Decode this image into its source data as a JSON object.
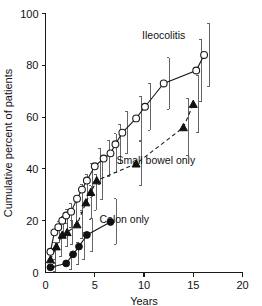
{
  "chart_data": {
    "type": "line",
    "title": "",
    "xlabel": "Years",
    "ylabel": "Cumulative percent of patients",
    "xlim": [
      0,
      20
    ],
    "ylim": [
      0,
      100
    ],
    "xticks": [
      0,
      5,
      10,
      15,
      20
    ],
    "yticks": [
      0,
      20,
      40,
      60,
      80,
      100
    ],
    "grid": false,
    "legend_position": "inline-annotations",
    "series": [
      {
        "name": "Ileocolitis",
        "marker": "open-circle",
        "linestyle": "solid",
        "label_x": 12.0,
        "label_y": 90.0,
        "points": [
          {
            "x": 0.5,
            "y": 8.0,
            "err_low": 5.0,
            "err_high": 11.5
          },
          {
            "x": 0.9,
            "y": 15.5,
            "err_low": 11.5,
            "err_high": 19.5
          },
          {
            "x": 1.3,
            "y": 17.5,
            "err_low": 13.5,
            "err_high": 21.5
          },
          {
            "x": 1.7,
            "y": 20.0,
            "err_low": 15.5,
            "err_high": 24.5
          },
          {
            "x": 2.1,
            "y": 22.0,
            "err_low": 17.5,
            "err_high": 26.5
          },
          {
            "x": 2.6,
            "y": 23.5,
            "err_low": 18.5,
            "err_high": 28.5
          },
          {
            "x": 3.2,
            "y": 28.5,
            "err_low": 23.0,
            "err_high": 34.0
          },
          {
            "x": 3.7,
            "y": 32.0,
            "err_low": 26.0,
            "err_high": 38.0
          },
          {
            "x": 4.2,
            "y": 35.5,
            "err_low": 29.0,
            "err_high": 42.0
          },
          {
            "x": 5.0,
            "y": 41.0,
            "err_low": 34.0,
            "err_high": 48.0
          },
          {
            "x": 5.9,
            "y": 44.0,
            "err_low": 37.0,
            "err_high": 51.0
          },
          {
            "x": 6.6,
            "y": 46.0,
            "err_low": 38.5,
            "err_high": 53.5
          },
          {
            "x": 7.1,
            "y": 49.5,
            "err_low": 42.0,
            "err_high": 57.0
          },
          {
            "x": 7.8,
            "y": 54.0,
            "err_low": 46.0,
            "err_high": 62.0
          },
          {
            "x": 9.2,
            "y": 59.5,
            "err_low": 51.0,
            "err_high": 68.0
          },
          {
            "x": 10.1,
            "y": 64.0,
            "err_low": 55.0,
            "err_high": 73.0
          },
          {
            "x": 12.0,
            "y": 73.0,
            "err_low": 63.0,
            "err_high": 83.0
          },
          {
            "x": 15.3,
            "y": 78.0,
            "err_low": 66.0,
            "err_high": 90.0
          },
          {
            "x": 16.1,
            "y": 84.0,
            "err_low": 72.0,
            "err_high": 96.0
          }
        ]
      },
      {
        "name": "Small bowel only",
        "marker": "filled-triangle",
        "linestyle": "dashed",
        "label_x": 11.2,
        "label_y": 42.0,
        "points": [
          {
            "x": 0.5,
            "y": 5.0,
            "err_low": 2.0,
            "err_high": 8.0
          },
          {
            "x": 1.1,
            "y": 10.0,
            "err_low": 6.0,
            "err_high": 14.0
          },
          {
            "x": 1.7,
            "y": 14.5,
            "err_low": 10.0,
            "err_high": 19.0
          },
          {
            "x": 2.2,
            "y": 15.5,
            "err_low": 11.0,
            "err_high": 20.0
          },
          {
            "x": 3.2,
            "y": 18.5,
            "err_low": 13.0,
            "err_high": 24.0
          },
          {
            "x": 4.1,
            "y": 27.0,
            "err_low": 20.5,
            "err_high": 33.5
          },
          {
            "x": 4.6,
            "y": 31.0,
            "err_low": 24.0,
            "err_high": 38.0
          },
          {
            "x": 5.2,
            "y": 35.5,
            "err_low": 28.0,
            "err_high": 43.0
          },
          {
            "x": 9.2,
            "y": 42.0,
            "err_low": 33.5,
            "err_high": 50.5
          },
          {
            "x": 14.0,
            "y": 56.0,
            "err_low": 45.0,
            "err_high": 67.0
          },
          {
            "x": 15.0,
            "y": 65.0,
            "err_low": 54.0,
            "err_high": 76.0
          }
        ]
      },
      {
        "name": "Colon only",
        "marker": "filled-circle",
        "linestyle": "solid",
        "label_x": 8.0,
        "label_y": 19.0,
        "points": [
          {
            "x": 0.5,
            "y": 2.0,
            "err_low": 0.5,
            "err_high": 3.5
          },
          {
            "x": 2.1,
            "y": 3.5,
            "err_low": 1.0,
            "err_high": 6.5
          },
          {
            "x": 2.8,
            "y": 7.0,
            "err_low": 3.0,
            "err_high": 11.5
          },
          {
            "x": 3.4,
            "y": 10.0,
            "err_low": 5.0,
            "err_high": 15.5
          },
          {
            "x": 4.2,
            "y": 14.5,
            "err_low": 8.0,
            "err_high": 21.0
          },
          {
            "x": 6.6,
            "y": 19.5,
            "err_low": 11.0,
            "err_high": 28.5
          }
        ]
      }
    ]
  },
  "axes": {
    "x_tick_labels": [
      "0",
      "5",
      "10",
      "15",
      "20"
    ],
    "y_tick_labels": [
      "0",
      "20",
      "40",
      "60",
      "80",
      "100"
    ],
    "x_axis_title": "Years",
    "y_axis_title": "Cumulative percent of patients"
  },
  "annotations": {
    "ileocolitis": "Ileocolitis",
    "small_bowel": "Small bowel only",
    "colon": "Colon only"
  },
  "colors": {
    "axis": "#1a1a1a",
    "line": "#1a1a1a",
    "errorbar": "#555555",
    "marker_fill": "#111111",
    "marker_open_fill": "#ffffff",
    "background": "#ffffff"
  }
}
